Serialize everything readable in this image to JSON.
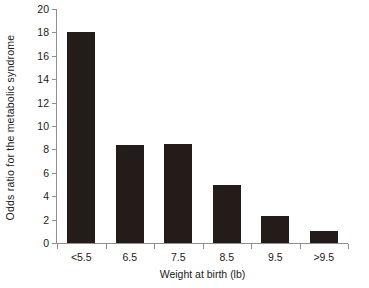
{
  "chart_data": {
    "type": "bar",
    "title": "",
    "subtitle": "",
    "categories": [
      "<5.5",
      "6.5",
      "7.5",
      "8.5",
      "9.5",
      ">9.5"
    ],
    "values": [
      18.0,
      8.4,
      8.5,
      5.0,
      2.3,
      1.0
    ],
    "xlabel": "Weight at birth (lb)",
    "ylabel": "Odds ratio for the metabolic syndrome",
    "ylim": [
      0,
      20
    ],
    "ytick_labels": [
      "0",
      "2",
      "4",
      "6",
      "8",
      "10",
      "12",
      "14",
      "16",
      "18",
      "20"
    ],
    "ytick_values": [
      0,
      2,
      4,
      6,
      8,
      10,
      12,
      14,
      16,
      18,
      20
    ],
    "grid": false,
    "legend": null,
    "bar_color": "#231c18",
    "axis_color": "#8f8f8f",
    "background_color": "#ffffff"
  }
}
